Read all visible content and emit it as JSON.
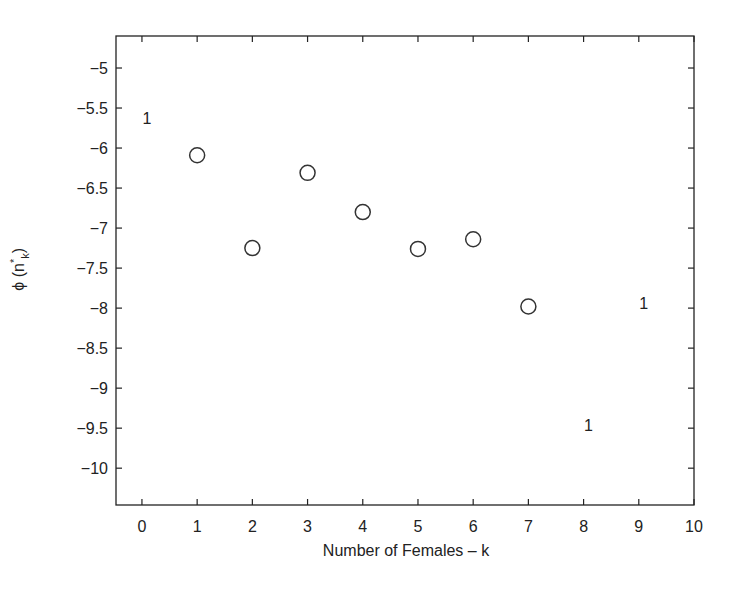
{
  "chart_data": {
    "type": "scatter",
    "title": "",
    "xlabel": "Number of Females – k",
    "ylabel": "ϕ (n*_k)",
    "ylabel_parts": {
      "phi": "ϕ (n",
      "sup": "*",
      "sub": "k",
      "close": ")"
    },
    "xlim": [
      -0.47,
      10
    ],
    "ylim": [
      -10.46,
      -4.6
    ],
    "xticks": [
      0,
      1,
      2,
      3,
      4,
      5,
      6,
      7,
      8,
      9,
      10
    ],
    "xtick_labels": [
      "0",
      "1",
      "2",
      "3",
      "4",
      "5",
      "6",
      "7",
      "8",
      "9",
      "10"
    ],
    "yticks": [
      -5,
      -5.5,
      -6,
      -6.5,
      -7,
      -7.5,
      -8,
      -8.5,
      -9,
      -9.5,
      -10
    ],
    "ytick_labels": [
      "−5",
      "−5.5",
      "−6",
      "−6.5",
      "−7",
      "−7.5",
      "−8",
      "−8.5",
      "−9",
      "−9.5",
      "−10"
    ],
    "grid": false,
    "legend": null,
    "series": [
      {
        "name": "circles",
        "marker": "o",
        "x": [
          1,
          2,
          3,
          4,
          5,
          6,
          7
        ],
        "y": [
          -6.09,
          -7.25,
          -6.31,
          -6.8,
          -7.26,
          -7.14,
          -7.98
        ]
      },
      {
        "name": "text-marker-1",
        "marker": "text",
        "text": "1",
        "x": [
          0.09,
          8.09,
          9.09
        ],
        "y": [
          -5.63,
          -9.46,
          -7.94
        ]
      }
    ]
  },
  "colors": {
    "axis": "#222222",
    "marker": "#333333",
    "background": "#ffffff"
  }
}
